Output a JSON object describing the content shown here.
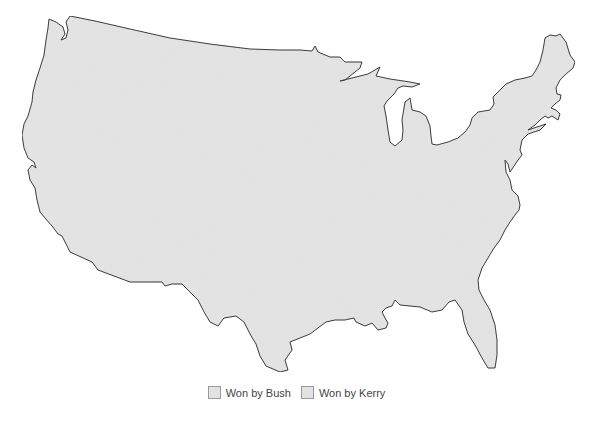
{
  "map": {
    "title": "",
    "region": "Contiguous United States",
    "fill_color": "#e4e4e4",
    "outline_color": "#333333",
    "county_relief_color": "#d4d4d4"
  },
  "legend": {
    "items": [
      {
        "label": "Won by Bush",
        "color": "#e2e2e2"
      },
      {
        "label": "Won by Kerry",
        "color": "#e2e2e2"
      }
    ]
  }
}
